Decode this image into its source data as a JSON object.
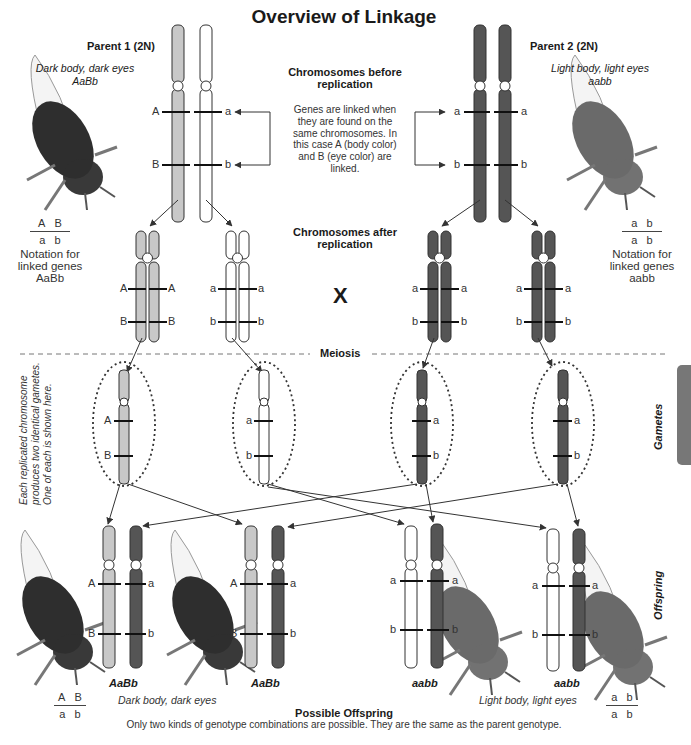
{
  "title": "Overview of Linkage",
  "parent1": {
    "label": "Parent 1 (2N)",
    "phenotype": "Dark body, dark eyes",
    "genotype": "AaBb",
    "notation": {
      "top": [
        "A",
        "B"
      ],
      "bottom": [
        "a",
        "b"
      ]
    },
    "notation_caption": [
      "Notation for",
      "linked genes",
      "AaBb"
    ]
  },
  "parent2": {
    "label": "Parent 2 (2N)",
    "phenotype": "Light body, light eyes",
    "genotype": "aabb",
    "notation": {
      "top": [
        "a",
        "b"
      ],
      "bottom": [
        "a",
        "b"
      ]
    },
    "notation_caption": [
      "Notation for",
      "linked genes",
      "aabb"
    ]
  },
  "center": {
    "before_heading": [
      "Chromosomes before",
      "replication"
    ],
    "explanation": [
      "Genes are linked when",
      "they are found on the",
      "same chromosomes. In",
      "this case A (body color)",
      "and B (eye color) are",
      "linked."
    ],
    "after_heading": [
      "Chromosomes after",
      "replication"
    ],
    "cross_symbol": "X",
    "meiosis_label": "Meiosis"
  },
  "side_labels": {
    "gametes": "Gametes",
    "offspring": "Offspring",
    "gamete_note": [
      "Each replicated chromosome",
      "produces two identical gametes.",
      "One of each is shown here."
    ]
  },
  "alleles": {
    "p1_before": {
      "left": [
        "A",
        "B"
      ],
      "right": [
        "a",
        "b"
      ]
    },
    "p2_before": {
      "left": [
        "a",
        "b"
      ],
      "right": [
        "a",
        "b"
      ]
    },
    "gametes": [
      [
        "A",
        "B"
      ],
      [
        "a",
        "b"
      ],
      [
        "a",
        "b"
      ],
      [
        "a",
        "b"
      ]
    ],
    "offspring": [
      {
        "left": [
          "A",
          "B"
        ],
        "right": [
          "a",
          "b"
        ]
      },
      {
        "left": [
          "A",
          "B"
        ],
        "right": [
          "a",
          "b"
        ]
      },
      {
        "left": [
          "a",
          "b"
        ],
        "right": [
          "a",
          "b"
        ]
      },
      {
        "left": [
          "a",
          "b"
        ],
        "right": [
          "a",
          "b"
        ]
      }
    ]
  },
  "offspring": {
    "genotypes": [
      "AaBb",
      "AaBb",
      "aabb",
      "aabb"
    ],
    "phenotype_dark": "Dark body, dark eyes",
    "phenotype_light": "Light body, light eyes",
    "notation_left": {
      "top": [
        "A",
        "B"
      ],
      "bottom": [
        "a",
        "b"
      ]
    },
    "notation_right": {
      "top": [
        "a",
        "b"
      ],
      "bottom": [
        "a",
        "b"
      ]
    },
    "heading": "Possible Offspring",
    "caption": "Only two kinds of genotype combinations are possible. They are the same as the parent genotype."
  },
  "colors": {
    "light_chrom": "#c8c8c8",
    "white_chrom": "#ffffff",
    "dark_chrom": "#555555",
    "outline": "#333333",
    "fly_dark": "#2e2e2e",
    "fly_light": "#6a6a6a"
  }
}
